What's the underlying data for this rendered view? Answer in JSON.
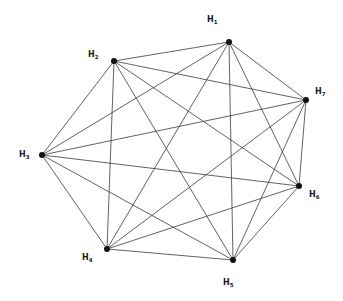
{
  "diagram": {
    "type": "complete-graph",
    "name": "K7",
    "nodes": [
      {
        "id": "H1",
        "letter": "H",
        "index": "1",
        "x": 229,
        "y": 42,
        "label_x": 207,
        "label_y": 16
      },
      {
        "id": "H2",
        "letter": "H",
        "index": "2",
        "x": 114,
        "y": 61,
        "label_x": 88,
        "label_y": 51
      },
      {
        "id": "H7",
        "letter": "H",
        "index": "7",
        "x": 306,
        "y": 100,
        "label_x": 315,
        "label_y": 88
      },
      {
        "id": "H3",
        "letter": "H",
        "index": "3",
        "x": 42,
        "y": 155,
        "label_x": 19,
        "label_y": 151
      },
      {
        "id": "H6",
        "letter": "H",
        "index": "6",
        "x": 299,
        "y": 186,
        "label_x": 309,
        "label_y": 191
      },
      {
        "id": "H4",
        "letter": "H",
        "index": "4",
        "x": 107,
        "y": 249,
        "label_x": 82,
        "label_y": 254
      },
      {
        "id": "H5",
        "letter": "H",
        "index": "5",
        "x": 233,
        "y": 260,
        "label_x": 223,
        "label_y": 279
      }
    ],
    "edges": [
      [
        "H1",
        "H2"
      ],
      [
        "H1",
        "H3"
      ],
      [
        "H1",
        "H4"
      ],
      [
        "H1",
        "H5"
      ],
      [
        "H1",
        "H6"
      ],
      [
        "H1",
        "H7"
      ],
      [
        "H2",
        "H3"
      ],
      [
        "H2",
        "H4"
      ],
      [
        "H2",
        "H5"
      ],
      [
        "H2",
        "H6"
      ],
      [
        "H2",
        "H7"
      ],
      [
        "H3",
        "H4"
      ],
      [
        "H3",
        "H5"
      ],
      [
        "H3",
        "H6"
      ],
      [
        "H3",
        "H7"
      ],
      [
        "H4",
        "H5"
      ],
      [
        "H4",
        "H6"
      ],
      [
        "H4",
        "H7"
      ],
      [
        "H5",
        "H6"
      ],
      [
        "H5",
        "H7"
      ],
      [
        "H6",
        "H7"
      ]
    ],
    "colors": {
      "edge": "#3a3a3a",
      "node": "#111111",
      "label": "#1a1a1a",
      "background": "#ffffff"
    }
  }
}
